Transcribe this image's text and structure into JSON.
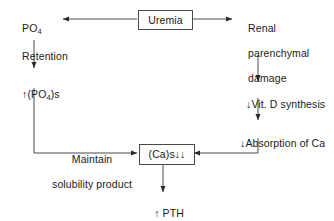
{
  "diagram": {
    "type": "flowchart",
    "line_color": "#4a4a4a",
    "text_color": "#1a1a1a",
    "background": "#ffffff",
    "nodes": [
      {
        "id": "po4-retention",
        "label": "PO4 Retention",
        "line1": "PO",
        "line1_sub": "4",
        "line2": "Retention",
        "shape": "plain"
      },
      {
        "id": "uremia",
        "label": "Uremia",
        "shape": "box"
      },
      {
        "id": "renal-damage",
        "label": "Renal parenchymal damage",
        "line1": "Renal",
        "line2": "parenchymal",
        "line3": "damage",
        "shape": "plain"
      },
      {
        "id": "po4-serum-up",
        "label": "↑(PO4)s",
        "prefix": "↑(PO",
        "sub": "4",
        "suffix": ")s",
        "shape": "plain"
      },
      {
        "id": "vit-d-synthesis-down",
        "label": "↓Vit. D synthesis",
        "shape": "plain"
      },
      {
        "id": "absorption-ca-down",
        "label": "↓Absorption of Ca",
        "shape": "plain"
      },
      {
        "id": "maintain-solubility",
        "label": "Maintain solubility product",
        "line1": "Maintain",
        "line2": "solubility product",
        "shape": "edge-label"
      },
      {
        "id": "ca-serum-down",
        "label": "(Ca)s↓↓",
        "shape": "box"
      },
      {
        "id": "pth-up",
        "label": "↑ PTH",
        "shape": "plain"
      }
    ],
    "edges": [
      {
        "id": "uremia-to-po4-retention",
        "from": "uremia",
        "to": "po4-retention",
        "direction": "left"
      },
      {
        "id": "uremia-to-renal-damage",
        "from": "uremia",
        "to": "renal-damage",
        "direction": "right"
      },
      {
        "id": "po4-retention-to-po4-serum",
        "from": "po4-retention",
        "to": "po4-serum-up",
        "direction": "down"
      },
      {
        "id": "po4-serum-to-ca-serum",
        "from": "po4-serum-up",
        "to": "ca-serum-down",
        "direction": "down-right",
        "label": "Maintain solubility product"
      },
      {
        "id": "renal-damage-to-vit-d",
        "from": "renal-damage",
        "to": "vit-d-synthesis-down",
        "direction": "down"
      },
      {
        "id": "vit-d-to-absorption",
        "from": "vit-d-synthesis-down",
        "to": "absorption-ca-down",
        "direction": "down"
      },
      {
        "id": "absorption-to-ca-serum",
        "from": "absorption-ca-down",
        "to": "ca-serum-down",
        "direction": "down-left"
      },
      {
        "id": "ca-serum-to-pth",
        "from": "ca-serum-down",
        "to": "pth-up",
        "direction": "down"
      }
    ]
  }
}
